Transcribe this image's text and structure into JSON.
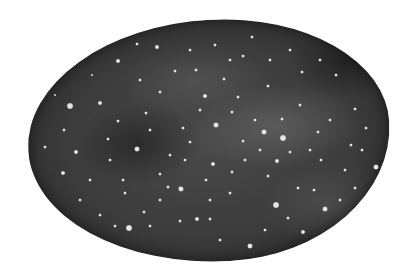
{
  "image": {
    "subject": "watercolor night sky oval",
    "background_color": "#ffffff",
    "blob_color_dark": "#1e1e1e",
    "blob_color_mid": "#3c3c3c",
    "blob_color_light": "#6a6a6a",
    "star_color": "#e8e8e8"
  },
  "stars": [
    [
      70,
      106,
      6
    ],
    [
      100,
      103,
      4
    ],
    [
      76,
      152,
      4
    ],
    [
      63,
      173,
      4
    ],
    [
      45,
      147,
      3
    ],
    [
      118,
      61,
      4
    ],
    [
      157,
      47,
      4
    ],
    [
      137,
      44,
      3
    ],
    [
      160,
      92,
      3
    ],
    [
      137,
      149,
      5
    ],
    [
      168,
      187,
      3
    ],
    [
      181,
      189,
      5
    ],
    [
      144,
      212,
      3
    ],
    [
      129,
      228,
      6
    ],
    [
      180,
      221,
      3
    ],
    [
      197,
      219,
      4
    ],
    [
      210,
      219,
      3
    ],
    [
      250,
      246,
      5
    ],
    [
      180,
      188,
      3
    ],
    [
      213,
      164,
      4
    ],
    [
      216,
      125,
      5
    ],
    [
      205,
      96,
      4
    ],
    [
      232,
      112,
      3
    ],
    [
      264,
      132,
      5
    ],
    [
      283,
      138,
      6
    ],
    [
      277,
      161,
      4
    ],
    [
      321,
      160,
      3
    ],
    [
      276,
      205,
      6
    ],
    [
      325,
      209,
      5
    ],
    [
      303,
      232,
      4
    ],
    [
      376,
      167,
      5
    ],
    [
      355,
      109,
      3
    ],
    [
      336,
      75,
      3
    ],
    [
      302,
      72,
      3
    ],
    [
      243,
      56,
      3
    ],
    [
      252,
      37,
      3
    ],
    [
      175,
      71,
      3
    ],
    [
      123,
      180,
      3
    ],
    [
      118,
      121,
      3
    ],
    [
      108,
      139,
      3
    ],
    [
      64,
      130,
      3
    ],
    [
      55,
      95,
      2
    ],
    [
      92,
      75,
      2
    ],
    [
      146,
      113,
      3
    ],
    [
      190,
      142,
      3
    ],
    [
      230,
      193,
      3
    ],
    [
      243,
      141,
      3
    ],
    [
      298,
      188,
      3
    ],
    [
      314,
      190,
      3
    ],
    [
      340,
      200,
      3
    ],
    [
      355,
      188,
      3
    ],
    [
      351,
      145,
      3
    ],
    [
      330,
      120,
      3
    ],
    [
      300,
      105,
      3
    ],
    [
      268,
      86,
      3
    ],
    [
      224,
      79,
      3
    ],
    [
      196,
      70,
      3
    ],
    [
      183,
      128,
      3
    ],
    [
      160,
      174,
      3
    ],
    [
      125,
      193,
      3
    ],
    [
      100,
      215,
      3
    ],
    [
      115,
      226,
      3
    ],
    [
      150,
      226,
      3
    ],
    [
      220,
      240,
      3
    ],
    [
      265,
      230,
      3
    ],
    [
      288,
      218,
      3
    ],
    [
      310,
      150,
      3
    ],
    [
      290,
      152,
      3
    ],
    [
      260,
      150,
      3
    ],
    [
      245,
      160,
      3
    ],
    [
      232,
      172,
      3
    ],
    [
      206,
      180,
      3
    ],
    [
      268,
      176,
      3
    ],
    [
      255,
      120,
      3
    ],
    [
      238,
      97,
      3
    ],
    [
      282,
      119,
      3
    ],
    [
      318,
      132,
      3
    ],
    [
      345,
      170,
      3
    ],
    [
      362,
      150,
      3
    ],
    [
      366,
      128,
      3
    ],
    [
      140,
      80,
      3
    ],
    [
      150,
      130,
      3
    ],
    [
      170,
      155,
      3
    ],
    [
      90,
      180,
      3
    ],
    [
      80,
      200,
      3
    ],
    [
      110,
      160,
      3
    ],
    [
      200,
      110,
      3
    ],
    [
      190,
      50,
      3
    ],
    [
      215,
      45,
      3
    ],
    [
      230,
      60,
      3
    ],
    [
      270,
      60,
      3
    ],
    [
      290,
      50,
      3
    ],
    [
      320,
      60,
      3
    ],
    [
      160,
      200,
      3
    ],
    [
      185,
      160,
      3
    ],
    [
      210,
      200,
      3
    ]
  ]
}
